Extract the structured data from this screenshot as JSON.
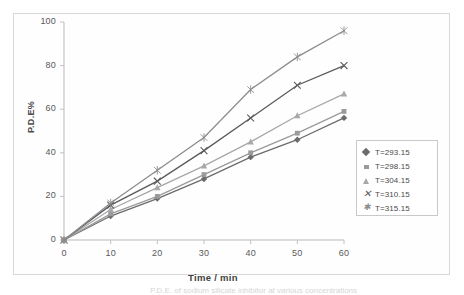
{
  "figure": {
    "caption_fragment": "P.D.E. of sodium silicate inhibitor at various concentrations"
  },
  "chart_data": {
    "type": "line",
    "title": "",
    "xlabel": "Time / min",
    "ylabel": "P.D.E%",
    "xlim": [
      0,
      60
    ],
    "ylim": [
      0,
      100
    ],
    "xticks": [
      0,
      10,
      20,
      30,
      40,
      50,
      60
    ],
    "yticks": [
      0,
      20,
      40,
      60,
      80,
      100
    ],
    "x": [
      0,
      10,
      20,
      30,
      40,
      50,
      60
    ],
    "grid": false,
    "legend_position": "right",
    "series": [
      {
        "name": "T=293.15",
        "marker": "diamond",
        "color": "#6b6b6d",
        "values": [
          0,
          11,
          19,
          28,
          38,
          46,
          56
        ]
      },
      {
        "name": "T=298.15",
        "marker": "square",
        "color": "#9a9a9c",
        "values": [
          0,
          12,
          20,
          30,
          40,
          49,
          59
        ]
      },
      {
        "name": "T=304.15",
        "marker": "triangle",
        "color": "#a8a8aa",
        "values": [
          0,
          14,
          24,
          34,
          45,
          57,
          67
        ]
      },
      {
        "name": "T=310.15",
        "marker": "x",
        "color": "#5a5a5c",
        "values": [
          0,
          16,
          27,
          41,
          56,
          71,
          80
        ]
      },
      {
        "name": "T=315.15",
        "marker": "star",
        "color": "#8d8d8f",
        "values": [
          0,
          17,
          32,
          47,
          69,
          84,
          96
        ]
      }
    ]
  }
}
